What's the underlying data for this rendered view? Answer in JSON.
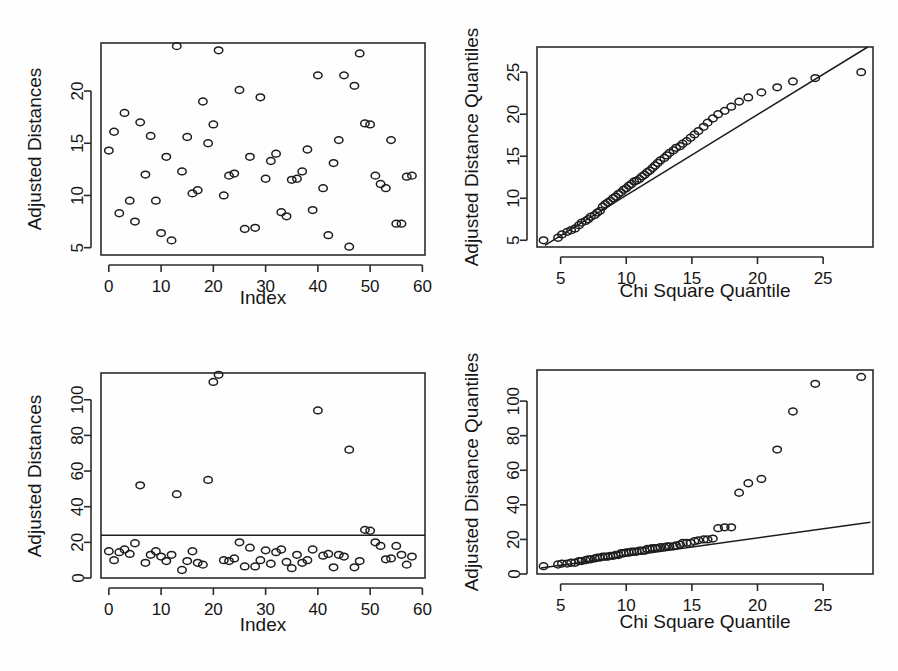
{
  "figure": {
    "title": "",
    "panel_count": 4,
    "background_color": "#fefefe",
    "ink_color": "#1d1d1d"
  },
  "chart_data": [
    {
      "id": "panel-top-left",
      "type": "scatter",
      "title": "",
      "xlabel": "Index",
      "ylabel": "Adjusted Distances",
      "xlim": [
        -1.5,
        60.5
      ],
      "ylim": [
        4.3,
        24.6
      ],
      "xticks": [
        0,
        10,
        20,
        30,
        40,
        50,
        60
      ],
      "yticks": [
        5,
        10,
        15,
        20
      ],
      "grid": false,
      "legend": "none",
      "x": [
        0,
        1,
        2,
        3,
        4,
        5,
        6,
        7,
        8,
        9,
        10,
        11,
        12,
        13,
        14,
        15,
        16,
        17,
        18,
        19,
        20,
        21,
        22,
        23,
        24,
        25,
        26,
        27,
        28,
        29,
        30,
        31,
        32,
        33,
        34,
        35,
        36,
        37,
        38,
        39,
        40,
        41,
        42,
        43,
        44,
        45,
        46,
        47,
        48,
        49,
        50,
        51,
        52,
        53,
        54,
        55,
        56,
        57,
        58
      ],
      "y": [
        14.3,
        16.1,
        8.3,
        17.9,
        9.5,
        7.5,
        17.0,
        12.0,
        15.7,
        9.5,
        6.4,
        13.7,
        5.7,
        24.3,
        12.3,
        15.6,
        10.2,
        10.5,
        19.0,
        15.0,
        16.8,
        23.9,
        10.0,
        11.9,
        12.1,
        20.1,
        6.8,
        13.7,
        6.9,
        19.4,
        11.6,
        13.3,
        14.0,
        8.4,
        8.0,
        11.5,
        11.6,
        12.3,
        14.4,
        8.6,
        21.5,
        10.7,
        6.2,
        13.1,
        15.3,
        21.5,
        5.1,
        20.5,
        23.6,
        16.9,
        16.8,
        11.9,
        11.1,
        10.7,
        15.3,
        7.3,
        7.3,
        11.8,
        11.9
      ]
    },
    {
      "id": "panel-top-right",
      "type": "scatter",
      "title": "",
      "xlabel": "Chi Square Quantile",
      "ylabel": "Adjusted Distance Quantiles",
      "xlim": [
        3.2,
        28.8
      ],
      "ylim": [
        4.2,
        28.0
      ],
      "xticks": [
        5,
        10,
        15,
        20,
        25
      ],
      "yticks": [
        5,
        10,
        15,
        20,
        25
      ],
      "grid": false,
      "legend": "none",
      "reference_line": {
        "type": "qq-line",
        "x1": 3.8,
        "y1": 4.4,
        "x2": 28.4,
        "y2": 28.0
      },
      "x": [
        3.7,
        4.8,
        5.1,
        5.5,
        5.8,
        6.1,
        6.4,
        6.6,
        6.9,
        7.1,
        7.3,
        7.6,
        7.8,
        8.0,
        8.2,
        8.4,
        8.6,
        8.8,
        9.0,
        9.2,
        9.4,
        9.6,
        9.8,
        10.0,
        10.2,
        10.4,
        10.6,
        10.8,
        11.0,
        11.2,
        11.4,
        11.6,
        11.8,
        12.0,
        12.2,
        12.4,
        12.6,
        12.9,
        13.1,
        13.3,
        13.6,
        13.8,
        14.1,
        14.3,
        14.6,
        14.9,
        15.2,
        15.5,
        15.9,
        16.2,
        16.6,
        17.0,
        17.5,
        18.0,
        18.6,
        19.3,
        20.3,
        21.5,
        22.7,
        24.4,
        27.9
      ],
      "y": [
        5.0,
        5.3,
        5.7,
        6.0,
        6.2,
        6.4,
        6.8,
        7.1,
        7.3,
        7.5,
        7.8,
        8.0,
        8.3,
        8.5,
        9.0,
        9.3,
        9.5,
        9.7,
        10.0,
        10.2,
        10.5,
        10.7,
        11.0,
        11.2,
        11.5,
        11.7,
        12.0,
        12.1,
        12.3,
        12.6,
        12.8,
        13.1,
        13.3,
        13.6,
        13.9,
        14.2,
        14.5,
        14.8,
        15.1,
        15.4,
        15.7,
        16.0,
        16.2,
        16.5,
        16.8,
        17.2,
        17.6,
        18.0,
        18.5,
        19.0,
        19.5,
        20.0,
        20.4,
        20.9,
        21.5,
        22.0,
        22.6,
        23.2,
        23.9,
        24.3,
        25.0
      ]
    },
    {
      "id": "panel-bottom-left",
      "type": "scatter",
      "title": "",
      "xlabel": "Index",
      "ylabel": "Adjusted Distances",
      "xlim": [
        -1.5,
        60.5
      ],
      "ylim": [
        0,
        115
      ],
      "xticks": [
        0,
        10,
        20,
        30,
        40,
        50,
        60
      ],
      "yticks": [
        0,
        20,
        40,
        60,
        80,
        100
      ],
      "grid": false,
      "legend": "none",
      "reference_line": {
        "type": "horizontal-cutoff",
        "value": 24.0
      },
      "x": [
        0,
        1,
        2,
        3,
        4,
        5,
        6,
        7,
        8,
        9,
        10,
        11,
        12,
        13,
        14,
        15,
        16,
        17,
        18,
        19,
        20,
        21,
        22,
        23,
        24,
        25,
        26,
        27,
        28,
        29,
        30,
        31,
        32,
        33,
        34,
        35,
        36,
        37,
        38,
        39,
        40,
        41,
        42,
        43,
        44,
        45,
        46,
        47,
        48,
        49,
        50,
        51,
        52,
        53,
        54,
        55,
        56,
        57,
        58
      ],
      "y": [
        15.0,
        10.0,
        14.5,
        16.0,
        13.5,
        19.5,
        52.0,
        8.5,
        13.0,
        15.0,
        12.0,
        9.5,
        13.0,
        47.0,
        4.5,
        9.5,
        15.0,
        8.5,
        7.5,
        55.0,
        110.0,
        114.0,
        10.0,
        9.5,
        11.0,
        20.0,
        6.5,
        17.0,
        6.5,
        10.0,
        15.5,
        8.0,
        14.5,
        16.0,
        9.0,
        5.5,
        13.0,
        8.5,
        10.0,
        16.0,
        94.0,
        12.5,
        13.5,
        6.0,
        13.0,
        12.0,
        72.0,
        6.0,
        9.5,
        27.0,
        26.5,
        20.0,
        18.0,
        10.5,
        11.0,
        18.0,
        13.0,
        7.5,
        12.0
      ]
    },
    {
      "id": "panel-bottom-right",
      "type": "scatter",
      "title": "",
      "xlabel": "Chi Square Quantile",
      "ylabel": "Adjusted Distance Quantiles",
      "xlim": [
        3.2,
        28.8
      ],
      "ylim": [
        0,
        118
      ],
      "xticks": [
        5,
        10,
        15,
        20,
        25
      ],
      "yticks": [
        0,
        20,
        40,
        60,
        80,
        100
      ],
      "grid": false,
      "legend": "none",
      "reference_line": {
        "type": "qq-line",
        "x1": 3.5,
        "y1": 3.5,
        "x2": 28.6,
        "y2": 30.0
      },
      "x": [
        3.7,
        4.8,
        5.1,
        5.5,
        5.8,
        6.1,
        6.4,
        6.6,
        6.9,
        7.1,
        7.3,
        7.6,
        7.8,
        8.0,
        8.2,
        8.4,
        8.6,
        8.8,
        9.0,
        9.2,
        9.4,
        9.6,
        9.8,
        10.0,
        10.2,
        10.4,
        10.6,
        10.8,
        11.0,
        11.2,
        11.4,
        11.6,
        11.8,
        12.0,
        12.2,
        12.4,
        12.6,
        12.9,
        13.1,
        13.3,
        13.6,
        13.8,
        14.1,
        14.3,
        14.6,
        14.9,
        15.2,
        15.5,
        15.9,
        16.2,
        16.6,
        17.0,
        17.5,
        18.0,
        18.6,
        19.3,
        20.3,
        21.5,
        22.7,
        24.4,
        27.9
      ],
      "y": [
        4.5,
        5.5,
        6.0,
        6.0,
        6.5,
        6.5,
        7.5,
        7.5,
        8.0,
        8.5,
        8.5,
        9.0,
        9.5,
        9.5,
        10.0,
        10.0,
        10.0,
        10.5,
        10.5,
        11.0,
        11.0,
        12.0,
        12.0,
        12.5,
        12.5,
        13.0,
        13.0,
        13.0,
        13.5,
        13.5,
        13.5,
        14.5,
        14.5,
        15.0,
        15.0,
        15.0,
        15.5,
        15.5,
        16.0,
        16.0,
        16.0,
        16.5,
        17.0,
        18.0,
        18.0,
        18.0,
        19.0,
        19.5,
        20.0,
        20.0,
        20.5,
        26.5,
        27.0,
        27.0,
        47.0,
        52.5,
        55.0,
        72.0,
        94.0,
        110.0,
        114.0
      ]
    }
  ]
}
